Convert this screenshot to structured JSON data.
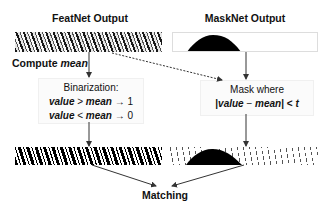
{
  "left_column": {
    "title": "FeatNet Output",
    "compute_label_prefix": "Compute ",
    "compute_label_var": "mean",
    "box": {
      "heading": "Binarization:",
      "rule1": {
        "lhs": "value",
        "op": " > ",
        "rhs": "mean",
        "arrow": " → ",
        "result": "1"
      },
      "rule2": {
        "lhs": "value",
        "op": " < ",
        "rhs": "mean",
        "arrow": " → ",
        "result": "0"
      }
    }
  },
  "right_column": {
    "title": "MaskNet Output",
    "box": {
      "heading": "Mask where",
      "cond_open": "|",
      "cond_lhs": "value",
      "cond_op": " − ",
      "cond_rhs": "mean",
      "cond_close": "| < ",
      "cond_t": "t"
    }
  },
  "bottom": {
    "label": "Matching"
  },
  "colors": {
    "ink": "#111111",
    "box_bg": "#fbfbfb",
    "arrow": "#333333"
  }
}
